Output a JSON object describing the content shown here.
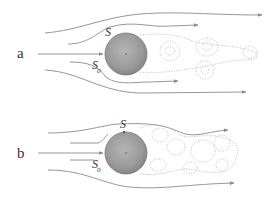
{
  "figure": {
    "panels": [
      {
        "id": "a",
        "label": "a",
        "separation_point_label": "S",
        "stagnation_point_label": "S",
        "stagnation_point_subscript": "0"
      },
      {
        "id": "b",
        "label": "b",
        "separation_point_label": "S",
        "stagnation_point_label": "S",
        "stagnation_point_subscript": "0"
      }
    ],
    "colors": {
      "sphere_fill": "#9a9a9a",
      "sphere_stroke": "#6e6e6e",
      "streamline": "#8a8a8a",
      "wake_dotted": "#b8b8b8",
      "background": "#ffffff"
    },
    "icons": {
      "sphere": "grey-shaded-circle",
      "flow_arrow": "right-arrowhead"
    }
  }
}
